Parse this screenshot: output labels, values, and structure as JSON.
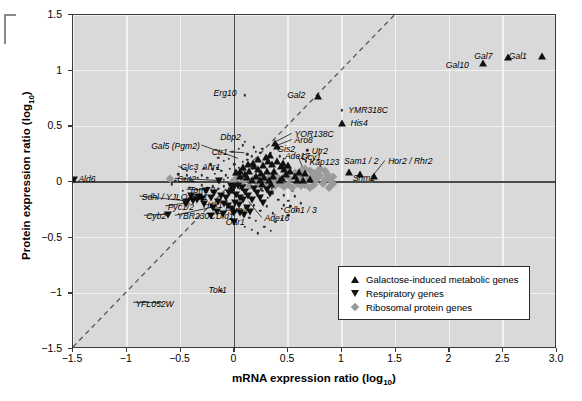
{
  "chart_data": {
    "type": "scatter",
    "title": "",
    "xlabel": "mRNA expression ratio (log10)",
    "ylabel": "Protein expression ratio (log10)",
    "xlim": [
      -1.5,
      3.0
    ],
    "ylim": [
      -1.5,
      1.5
    ],
    "xticks": [
      "-1.5",
      "-1",
      "-0.5",
      "0",
      "0.5",
      "1",
      "1.5",
      "2",
      "2.5",
      "3.0"
    ],
    "xtick_values": [
      -1.5,
      -1,
      -0.5,
      0,
      0.5,
      1,
      1.5,
      2,
      2.5,
      3.0
    ],
    "yticks": [
      "1.5",
      "1",
      "0.5",
      "0",
      "-0.5",
      "-1",
      "-1.5"
    ],
    "ytick_values": [
      1.5,
      1,
      0.5,
      0,
      -0.5,
      -1,
      -1.5
    ],
    "grid": true,
    "grid_color": "#f2f2f2",
    "background": "#d9d9d9",
    "reference_line": {
      "type": "diagonal",
      "style": "dashed",
      "from": [
        -1.5,
        -1.5
      ],
      "to": [
        1.5,
        1.5
      ]
    },
    "legend_position": "bottom-right",
    "legend": [
      {
        "symbol": "triangle-up",
        "label": "Galactose-induced metabolic genes",
        "color": "#111111"
      },
      {
        "symbol": "triangle-down",
        "label": "Respiratory genes",
        "color": "#111111"
      },
      {
        "symbol": "diamond",
        "label": "Ribosomal protein genes",
        "color": "#9a9a9a"
      }
    ],
    "annotations": [
      {
        "label": "Gal1",
        "x": 2.72,
        "y": 1.13,
        "anchor": "right",
        "marker": "triangle-up",
        "mx": 2.86,
        "my": 1.13
      },
      {
        "label": "Gal7",
        "x": 2.4,
        "y": 1.13,
        "anchor": "right",
        "marker": "triangle-up",
        "mx": 2.54,
        "my": 1.12
      },
      {
        "label": "Gal10",
        "x": 2.18,
        "y": 1.05,
        "anchor": "right",
        "marker": "triangle-up",
        "mx": 2.31,
        "my": 1.07
      },
      {
        "label": "Erg10",
        "x": 0.02,
        "y": 0.8,
        "anchor": "right",
        "marker": "dot",
        "mx": 0.1,
        "my": 0.78
      },
      {
        "label": "Gal2",
        "x": 0.66,
        "y": 0.78,
        "anchor": "right",
        "marker": "triangle-up",
        "mx": 0.78,
        "my": 0.77
      },
      {
        "label": "YMR318C",
        "x": 1.06,
        "y": 0.64,
        "anchor": "left",
        "marker": "dot",
        "mx": 1.0,
        "my": 0.645
      },
      {
        "label": "His4",
        "x": 1.08,
        "y": 0.53,
        "anchor": "left",
        "marker": "triangle-up",
        "mx": 1.0,
        "my": 0.53
      },
      {
        "label": "YOR138C",
        "x": 0.56,
        "y": 0.43,
        "anchor": "left",
        "marker": "triangle-up",
        "mx": 0.38,
        "my": 0.35
      },
      {
        "label": "Aro8",
        "x": 0.56,
        "y": 0.375,
        "anchor": "left",
        "marker": "triangle-up",
        "mx": 0.4,
        "my": 0.32
      },
      {
        "label": "Dbp2",
        "x": 0.06,
        "y": 0.4,
        "anchor": "right",
        "marker": "dot",
        "mx": 0.1,
        "my": 0.36
      },
      {
        "label": "Gal5 (Pgm2)",
        "x": -0.32,
        "y": 0.325,
        "anchor": "right",
        "marker": "none",
        "mx": 0.04,
        "my": 0.205
      },
      {
        "label": "Ctr1",
        "x": -0.06,
        "y": 0.265,
        "anchor": "right",
        "marker": "none",
        "mx": 0.1,
        "my": 0.255
      },
      {
        "label": "Gis2",
        "x": 0.4,
        "y": 0.295,
        "anchor": "left",
        "marker": "triangle-up",
        "mx": 0.33,
        "my": 0.24
      },
      {
        "label": "Ade17",
        "x": 0.47,
        "y": 0.235,
        "anchor": "left",
        "marker": "triangle-up",
        "mx": 0.4,
        "my": 0.185
      },
      {
        "label": "Gcy1",
        "x": 0.62,
        "y": 0.225,
        "anchor": "left",
        "marker": "triangle-up",
        "mx": 0.66,
        "my": 0.08
      },
      {
        "label": "Utr2",
        "x": 0.72,
        "y": 0.275,
        "anchor": "left",
        "marker": "dot",
        "mx": 0.68,
        "my": 0.285
      },
      {
        "label": "Kap123",
        "x": 0.7,
        "y": 0.175,
        "anchor": "left",
        "marker": "dot",
        "mx": 0.665,
        "my": 0.185
      },
      {
        "label": "Sam1 / 2",
        "x": 1.02,
        "y": 0.185,
        "anchor": "left",
        "marker": "triangle-up",
        "mx": 1.07,
        "my": 0.09
      },
      {
        "label": "Hor2 / Rhr2",
        "x": 1.43,
        "y": 0.185,
        "anchor": "left",
        "marker": "triangle-up",
        "mx": 1.3,
        "my": 0.05
      },
      {
        "label": "Shm2",
        "x": 1.1,
        "y": 0.035,
        "anchor": "left",
        "marker": "triangle-up",
        "mx": 1.17,
        "my": 0.07
      },
      {
        "label": "Glc3",
        "x": -0.5,
        "y": 0.135,
        "anchor": "left",
        "marker": "none",
        "mx": -0.44,
        "my": 0.1
      },
      {
        "label": "Ahr1",
        "x": -0.3,
        "y": 0.135,
        "anchor": "left",
        "marker": "dot",
        "mx": -0.2,
        "my": 0.115
      },
      {
        "label": "Gut2",
        "x": -0.53,
        "y": 0.025,
        "anchor": "left",
        "marker": "triangle-down",
        "mx": -0.14,
        "my": 0.005
      },
      {
        "label": "Ald6",
        "x": -1.45,
        "y": 0.02,
        "anchor": "left",
        "marker": "triangle-down",
        "mx": -1.49,
        "my": 0.02
      },
      {
        "label": "Tom70",
        "x": -0.42,
        "y": -0.075,
        "anchor": "left",
        "marker": "triangle-down",
        "mx": -0.26,
        "my": -0.08
      },
      {
        "label": "Ach1",
        "x": -0.43,
        "y": -0.135,
        "anchor": "left",
        "marker": "triangle-down",
        "mx": -0.3,
        "my": -0.155
      },
      {
        "label": "Sdhl / YJLO45W",
        "x": -0.86,
        "y": -0.135,
        "anchor": "left",
        "marker": "triangle-down",
        "mx": -0.44,
        "my": -0.18
      },
      {
        "label": "Hxk1",
        "x": -0.29,
        "y": -0.205,
        "anchor": "left",
        "marker": "dot",
        "mx": -0.21,
        "my": -0.215
      },
      {
        "label": "Pyc1/2",
        "x": -0.62,
        "y": -0.225,
        "anchor": "left",
        "marker": "triangle-down",
        "mx": -0.45,
        "my": -0.2
      },
      {
        "label": "Cyb2",
        "x": -0.82,
        "y": -0.31,
        "anchor": "left",
        "marker": "triangle-down",
        "mx": -0.62,
        "my": -0.3
      },
      {
        "label": "YBR230C",
        "x": -0.53,
        "y": -0.31,
        "anchor": "left",
        "marker": "none",
        "mx": -0.17,
        "my": -0.23
      },
      {
        "label": "Dld1",
        "x": -0.17,
        "y": -0.31,
        "anchor": "left",
        "marker": "triangle-down",
        "mx": -0.215,
        "my": -0.305
      },
      {
        "label": "Pgm1",
        "x": -0.09,
        "y": -0.255,
        "anchor": "left",
        "marker": "dot",
        "mx": -0.055,
        "my": -0.21
      },
      {
        "label": "Oar1",
        "x": -0.08,
        "y": -0.36,
        "anchor": "left",
        "marker": "triangle-down",
        "mx": 0.0,
        "my": -0.355
      },
      {
        "label": "Ade16",
        "x": 0.28,
        "y": -0.33,
        "anchor": "left",
        "marker": "none",
        "mx": 0.14,
        "my": -0.185
      },
      {
        "label": "Gdh1 / 3",
        "x": 0.46,
        "y": -0.255,
        "anchor": "left",
        "marker": "dot",
        "mx": 0.44,
        "my": -0.24
      },
      {
        "label": "Tok1",
        "x": -0.24,
        "y": -0.97,
        "anchor": "left",
        "marker": "dot",
        "mx": -0.12,
        "my": -0.975
      },
      {
        "label": "YFL052W",
        "x": -0.92,
        "y": -1.095,
        "anchor": "left",
        "marker": "none",
        "mx": -0.66,
        "my": -1.1
      }
    ]
  },
  "scatter_points": {
    "triangle_up": [
      [
        2.86,
        1.13
      ],
      [
        2.54,
        1.12
      ],
      [
        2.31,
        1.07
      ],
      [
        0.78,
        0.77
      ],
      [
        1.0,
        0.53
      ],
      [
        0.38,
        0.35
      ],
      [
        0.4,
        0.32
      ],
      [
        0.33,
        0.24
      ],
      [
        0.4,
        0.185
      ],
      [
        0.66,
        0.08
      ],
      [
        1.07,
        0.09
      ],
      [
        1.3,
        0.05
      ],
      [
        1.17,
        0.07
      ],
      [
        0.31,
        0.19
      ],
      [
        0.27,
        0.155
      ],
      [
        0.35,
        0.165
      ],
      [
        0.43,
        0.145
      ],
      [
        0.46,
        0.12
      ],
      [
        0.22,
        0.12
      ],
      [
        0.25,
        0.085
      ],
      [
        0.3,
        0.1
      ],
      [
        0.37,
        0.095
      ],
      [
        0.48,
        0.075
      ],
      [
        0.52,
        0.1
      ],
      [
        0.18,
        0.14
      ],
      [
        0.14,
        0.1
      ],
      [
        0.1,
        0.075
      ],
      [
        0.2,
        0.055
      ],
      [
        0.28,
        0.045
      ],
      [
        0.36,
        0.05
      ],
      [
        0.44,
        0.04
      ],
      [
        0.56,
        0.055
      ],
      [
        0.6,
        0.09
      ],
      [
        0.08,
        0.135
      ],
      [
        0.05,
        0.1
      ],
      [
        0.12,
        0.045
      ],
      [
        0.05,
        0.055
      ],
      [
        0.02,
        0.09
      ],
      [
        0.16,
        0.02
      ],
      [
        0.24,
        0.015
      ],
      [
        0.32,
        0.02
      ],
      [
        0.42,
        0.015
      ],
      [
        0.58,
        0.02
      ],
      [
        0.64,
        0.015
      ],
      [
        0.7,
        0.03
      ],
      [
        0.22,
        0.21
      ],
      [
        0.29,
        0.225
      ],
      [
        0.17,
        0.175
      ],
      [
        0.13,
        0.16
      ],
      [
        0.45,
        0.175
      ],
      [
        0.5,
        0.15
      ],
      [
        0.26,
        -0.015
      ],
      [
        0.34,
        -0.02
      ]
    ],
    "triangle_down": [
      [
        -1.49,
        0.02
      ],
      [
        -0.14,
        0.005
      ],
      [
        -0.26,
        -0.08
      ],
      [
        -0.3,
        -0.155
      ],
      [
        -0.44,
        -0.18
      ],
      [
        -0.38,
        -0.175
      ],
      [
        -0.45,
        -0.2
      ],
      [
        -0.62,
        -0.3
      ],
      [
        -0.215,
        -0.305
      ],
      [
        0.0,
        -0.355
      ],
      [
        -0.19,
        -0.1
      ],
      [
        -0.12,
        -0.125
      ],
      [
        -0.08,
        -0.145
      ],
      [
        -0.05,
        -0.1
      ],
      [
        -0.02,
        -0.085
      ],
      [
        0.02,
        -0.115
      ],
      [
        0.05,
        -0.14
      ],
      [
        0.08,
        -0.16
      ],
      [
        -0.15,
        -0.18
      ],
      [
        -0.1,
        -0.2
      ],
      [
        -0.06,
        -0.22
      ],
      [
        -0.02,
        -0.245
      ],
      [
        0.01,
        -0.185
      ],
      [
        0.04,
        -0.21
      ],
      [
        0.1,
        -0.09
      ],
      [
        0.13,
        -0.125
      ],
      [
        0.16,
        -0.16
      ],
      [
        0.18,
        -0.06
      ],
      [
        0.21,
        -0.1
      ],
      [
        0.07,
        -0.05
      ],
      [
        0.03,
        -0.04
      ],
      [
        -0.03,
        -0.04
      ],
      [
        -0.22,
        -0.145
      ],
      [
        -0.28,
        -0.195
      ],
      [
        -0.33,
        -0.135
      ],
      [
        -0.2,
        -0.235
      ],
      [
        -0.16,
        -0.265
      ],
      [
        -0.11,
        -0.29
      ],
      [
        0.0,
        -0.275
      ],
      [
        0.05,
        -0.275
      ],
      [
        0.24,
        -0.145
      ],
      [
        0.27,
        -0.19
      ],
      [
        0.12,
        -0.235
      ],
      [
        0.15,
        -0.27
      ],
      [
        0.09,
        -0.3
      ],
      [
        0.3,
        -0.07
      ],
      [
        0.33,
        -0.11
      ],
      [
        -0.4,
        -0.125
      ],
      [
        -0.35,
        -0.16
      ],
      [
        0.0,
        -0.045
      ]
    ],
    "diamond": [
      [
        -0.6,
        0.025
      ],
      [
        0.6,
        0.04
      ],
      [
        0.64,
        0.07
      ],
      [
        0.68,
        0.015
      ],
      [
        0.72,
        0.05
      ],
      [
        0.76,
        0.02
      ],
      [
        0.8,
        0.055
      ],
      [
        0.84,
        0.015
      ],
      [
        0.88,
        0.04
      ],
      [
        0.56,
        0.085
      ],
      [
        0.52,
        0.03
      ],
      [
        0.48,
        0.06
      ],
      [
        0.44,
        0.02
      ],
      [
        0.4,
        0.045
      ],
      [
        0.36,
        0.015
      ],
      [
        0.7,
        0.1
      ],
      [
        0.74,
        0.085
      ],
      [
        0.66,
        0.115
      ],
      [
        0.62,
        0.095
      ],
      [
        0.78,
        0.09
      ],
      [
        0.58,
        -0.02
      ],
      [
        0.62,
        -0.04
      ],
      [
        0.66,
        -0.025
      ],
      [
        0.7,
        -0.05
      ],
      [
        0.74,
        -0.03
      ],
      [
        0.54,
        -0.05
      ],
      [
        0.5,
        -0.025
      ],
      [
        0.46,
        -0.045
      ],
      [
        0.42,
        -0.02
      ],
      [
        0.82,
        -0.02
      ],
      [
        0.86,
        0.075
      ],
      [
        0.9,
        0.01
      ],
      [
        0.92,
        0.045
      ],
      [
        0.38,
        -0.04
      ],
      [
        0.34,
        0.05
      ],
      [
        0.3,
        0.02
      ],
      [
        0.3,
        -0.03
      ],
      [
        0.26,
        0.04
      ],
      [
        0.22,
        -0.02
      ],
      [
        0.18,
        0.03
      ],
      [
        0.14,
        -0.035
      ],
      [
        0.1,
        0.02
      ],
      [
        0.06,
        -0.02
      ],
      [
        0.02,
        0.03
      ],
      [
        -0.02,
        -0.01
      ],
      [
        0.8,
        0.115
      ],
      [
        0.84,
        0.1
      ],
      [
        0.88,
        -0.05
      ],
      [
        0.92,
        -0.02
      ],
      [
        0.5,
        0.115
      ]
    ],
    "dot_cloud": [
      [
        0.1,
        0.78
      ],
      [
        1.0,
        0.645
      ],
      [
        0.1,
        0.36
      ],
      [
        -0.2,
        0.115
      ],
      [
        -0.21,
        -0.215
      ],
      [
        -0.055,
        -0.21
      ],
      [
        0.44,
        -0.24
      ],
      [
        -0.12,
        -0.975
      ],
      [
        -0.44,
        0.1
      ],
      [
        0.68,
        0.285
      ],
      [
        0.665,
        0.185
      ],
      [
        -0.44,
        0.06
      ],
      [
        -0.36,
        0.09
      ],
      [
        -0.3,
        0.06
      ],
      [
        -0.25,
        0.04
      ],
      [
        -0.18,
        0.075
      ],
      [
        -0.12,
        0.1
      ],
      [
        -0.08,
        0.06
      ],
      [
        -0.04,
        0.12
      ],
      [
        0.0,
        0.16
      ],
      [
        0.04,
        0.13
      ],
      [
        0.08,
        0.18
      ],
      [
        -0.16,
        0.13
      ],
      [
        -0.22,
        0.16
      ],
      [
        -0.28,
        0.12
      ],
      [
        -0.34,
        0.04
      ],
      [
        -0.4,
        0.02
      ],
      [
        -0.46,
        0.03
      ],
      [
        -0.14,
        0.03
      ],
      [
        -0.1,
        0.02
      ],
      [
        -0.06,
        0.04
      ],
      [
        -0.02,
        0.02
      ],
      [
        0.02,
        0.05
      ],
      [
        0.06,
        0.02
      ],
      [
        0.12,
        0.25
      ],
      [
        0.16,
        0.23
      ],
      [
        0.2,
        0.27
      ],
      [
        0.24,
        0.26
      ],
      [
        -0.05,
        0.21
      ],
      [
        -0.1,
        0.19
      ],
      [
        -0.15,
        0.22
      ],
      [
        0.3,
        0.22
      ],
      [
        0.34,
        0.26
      ],
      [
        0.26,
        0.3
      ],
      [
        0.18,
        0.31
      ],
      [
        -0.25,
        -0.05
      ],
      [
        -0.3,
        -0.03
      ],
      [
        -0.35,
        -0.07
      ],
      [
        -0.42,
        -0.05
      ],
      [
        -0.48,
        -0.08
      ],
      [
        -0.2,
        -0.04
      ],
      [
        -0.15,
        -0.06
      ],
      [
        -0.1,
        -0.04
      ],
      [
        -0.05,
        -0.06
      ],
      [
        0.0,
        -0.03
      ],
      [
        0.05,
        -0.06
      ],
      [
        0.1,
        -0.03
      ],
      [
        0.15,
        -0.05
      ],
      [
        0.2,
        -0.03
      ],
      [
        0.25,
        -0.06
      ],
      [
        0.3,
        -0.04
      ],
      [
        0.35,
        -0.06
      ],
      [
        0.4,
        -0.03
      ],
      [
        0.22,
        -0.12
      ],
      [
        0.26,
        -0.08
      ],
      [
        0.31,
        -0.14
      ],
      [
        0.36,
        -0.1
      ],
      [
        0.41,
        -0.16
      ],
      [
        0.46,
        -0.12
      ],
      [
        0.18,
        -0.21
      ],
      [
        0.24,
        -0.26
      ],
      [
        0.3,
        -0.22
      ],
      [
        0.36,
        -0.28
      ],
      [
        0.14,
        -0.32
      ],
      [
        0.2,
        -0.35
      ],
      [
        0.46,
        -0.21
      ],
      [
        0.5,
        -0.17
      ],
      [
        0.54,
        -0.08
      ],
      [
        0.56,
        -0.13
      ],
      [
        0.52,
        -0.22
      ],
      [
        -0.55,
        0.01
      ],
      [
        -0.52,
        0.07
      ],
      [
        -0.58,
        -0.02
      ],
      [
        0.42,
        0.23
      ],
      [
        0.46,
        0.21
      ],
      [
        0.04,
        0.3
      ],
      [
        0.08,
        0.33
      ],
      [
        -0.02,
        0.27
      ],
      [
        0.12,
        0.2
      ],
      [
        0.01,
        0.02
      ],
      [
        0.5,
        -0.3
      ],
      [
        0.44,
        -0.33
      ],
      [
        0.38,
        -0.36
      ],
      [
        0.58,
        -0.26
      ],
      [
        0.62,
        -0.19
      ],
      [
        0.28,
        -0.4
      ],
      [
        0.34,
        -0.44
      ],
      [
        0.22,
        -0.46
      ],
      [
        0.16,
        -0.43
      ],
      [
        0.1,
        -0.4
      ]
    ]
  }
}
